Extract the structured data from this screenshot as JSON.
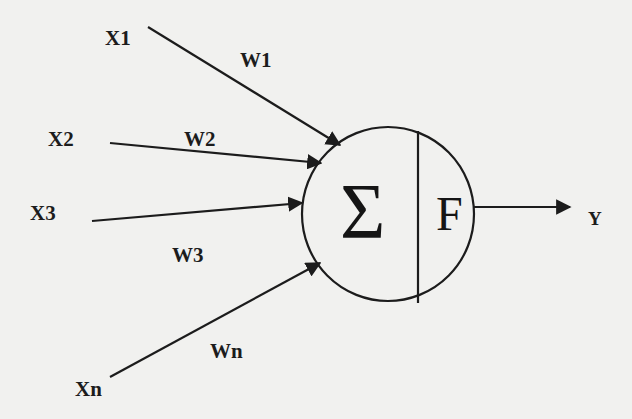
{
  "diagram": {
    "type": "artificial-neuron (perceptron)",
    "colors": {
      "background": "#f1f1ef",
      "ink": "#1c1c1c"
    },
    "inputs": [
      {
        "label": "X1",
        "weight": "W1"
      },
      {
        "label": "X2",
        "weight": "W2"
      },
      {
        "label": "X3",
        "weight": "W3"
      },
      {
        "label": "Xn",
        "weight": "Wn"
      }
    ],
    "neuron": {
      "summation_symbol": "Σ",
      "activation_symbol": "F"
    },
    "output": {
      "label": "Y"
    }
  }
}
